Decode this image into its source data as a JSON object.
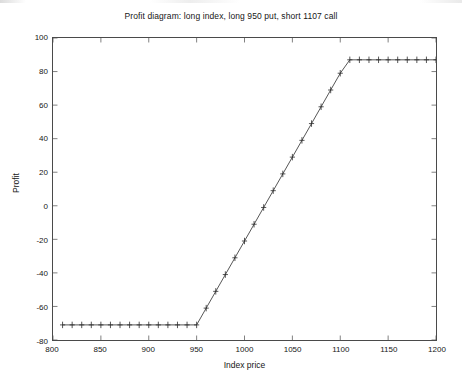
{
  "figure": {
    "width": 462,
    "height": 390,
    "background": "#ffffff",
    "axes_color": "#4a4a4a",
    "line_color": "#2b2b2b",
    "marker": "plus"
  },
  "chart_data": {
    "type": "line",
    "title": "Profit diagram: long index, long 950 put, short 1107 call",
    "xlabel": "Index price",
    "ylabel": "Profit",
    "xlim": [
      800,
      1200
    ],
    "ylim": [
      -80,
      100
    ],
    "xticks": [
      800,
      850,
      900,
      950,
      1000,
      1050,
      1100,
      1150,
      1200
    ],
    "yticks": [
      -80,
      -60,
      -40,
      -20,
      0,
      20,
      40,
      60,
      80,
      100
    ],
    "xtick_labels": [
      "800",
      "850",
      "900",
      "950",
      "1000",
      "1050",
      "1100",
      "1150",
      "1200"
    ],
    "ytick_labels": [
      "-80",
      "-60",
      "-40",
      "-20",
      "0",
      "20",
      "40",
      "60",
      "80",
      "100"
    ],
    "grid": false,
    "legend": null,
    "marker_style": "+",
    "series": [
      {
        "name": "Profit",
        "x": [
          810,
          820,
          830,
          840,
          850,
          860,
          870,
          880,
          890,
          900,
          910,
          920,
          930,
          940,
          950,
          960,
          970,
          980,
          990,
          1000,
          1010,
          1020,
          1030,
          1040,
          1050,
          1060,
          1070,
          1080,
          1090,
          1100,
          1110,
          1120,
          1130,
          1140,
          1150,
          1160,
          1170,
          1180,
          1190,
          1200
        ],
        "y": [
          -71,
          -71,
          -71,
          -71,
          -71,
          -71,
          -71,
          -71,
          -71,
          -71,
          -71,
          -71,
          -71,
          -71,
          -71,
          -61,
          -51,
          -41,
          -31,
          -21,
          -11,
          -1,
          9,
          19,
          29,
          39,
          49,
          59,
          69,
          79,
          87,
          87,
          87,
          87,
          87,
          87,
          87,
          87,
          87,
          87
        ]
      }
    ],
    "breakpoints": {
      "put_strike": 950,
      "call_strike": 1107,
      "max_loss": -71,
      "max_profit": 87
    }
  }
}
